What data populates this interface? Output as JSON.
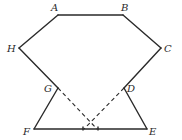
{
  "diagram": {
    "type": "geometry-figure",
    "labels": {
      "A": "A",
      "B": "B",
      "C": "C",
      "D": "D",
      "E": "E",
      "F": "F",
      "G": "G",
      "H": "H"
    },
    "solid_segments": [
      "AB",
      "BC",
      "CD",
      "DE",
      "EF",
      "FG",
      "GH",
      "HA"
    ],
    "dashed_segments": [
      "G to point on FE",
      "D to point on FE"
    ],
    "stroke_color": "#2a2a2a"
  }
}
